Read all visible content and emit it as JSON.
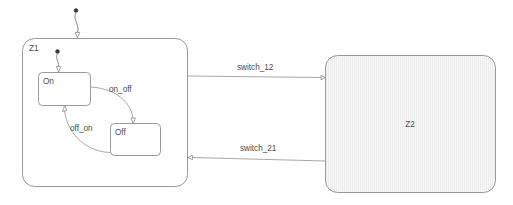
{
  "diagram": {
    "type": "statechart",
    "background": "#ffffff",
    "line_color": "#9a9a9a",
    "text_color": "#4c4c4c",
    "regions": [
      {
        "id": "Z1",
        "label": "Z1",
        "fill": "white",
        "label_position": "top-left"
      },
      {
        "id": "Z2",
        "label": "Z2",
        "fill": "hatched",
        "label_position": "center"
      }
    ],
    "states": [
      {
        "id": "On",
        "label": "On",
        "parent": "Z1"
      },
      {
        "id": "Off",
        "label": "Off",
        "parent": "Z1"
      }
    ],
    "initial_markers": [
      {
        "id": "init-top",
        "target": "Z1",
        "style": "filled-dot-curved-arrow"
      },
      {
        "id": "init-on",
        "target": "On",
        "style": "filled-dot-curved-arrow"
      }
    ],
    "transitions": [
      {
        "id": "on_off",
        "label": "on_off",
        "from": "On",
        "to": "Off"
      },
      {
        "id": "off_on",
        "label": "off_on",
        "from": "Off",
        "to": "On"
      },
      {
        "id": "switch_12",
        "label": "switch_12",
        "from": "Z1",
        "to": "Z2"
      },
      {
        "id": "switch_21",
        "label": "switch_21",
        "from": "Z2",
        "to": "Z1"
      }
    ]
  }
}
